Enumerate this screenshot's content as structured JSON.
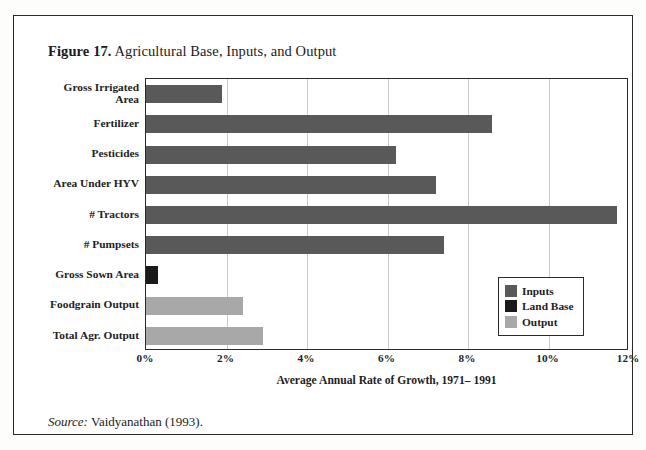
{
  "figure": {
    "number_label": "Figure 17.",
    "title": "Agricultural Base, Inputs, and Output",
    "source_label": "Source:",
    "source_text": " Vaidyanathan (1993)."
  },
  "colors": {
    "inputs": "#595959",
    "land_base": "#1a1a1a",
    "output": "#a8a8a8",
    "frame": "#2b2b2b",
    "gridline": "#c9c9c9",
    "background": "#ffffff"
  },
  "legend": {
    "position": "inside-bottom-right",
    "items": [
      {
        "label": "Inputs",
        "color": "#595959"
      },
      {
        "label": "Land Base",
        "color": "#1a1a1a"
      },
      {
        "label": "Output",
        "color": "#a8a8a8"
      }
    ]
  },
  "chart_data": {
    "type": "bar",
    "orientation": "horizontal",
    "title": "Figure 17. Agricultural Base, Inputs, and Output",
    "xlabel": "Average Annual Rate of Growth, 1971– 1991",
    "ylabel": "",
    "xlim": [
      0,
      12
    ],
    "xtick_values": [
      0,
      2,
      4,
      6,
      8,
      10,
      12
    ],
    "xtick_labels": [
      "0%",
      "2%",
      "4%",
      "6%",
      "8%",
      "10%",
      "12%"
    ],
    "grid": "vertical",
    "legend": [
      "Inputs",
      "Land Base",
      "Output"
    ],
    "categories": [
      "Gross Irrigated Area",
      "Fertilizer",
      "Pesticides",
      "Area Under HYV",
      "# Tractors",
      "# Pumpsets",
      "Gross Sown Area",
      "Foodgrain Output",
      "Total Agr. Output"
    ],
    "values": [
      1.9,
      8.6,
      6.2,
      7.2,
      11.7,
      7.4,
      0.3,
      2.4,
      2.9
    ],
    "groups": [
      "Inputs",
      "Inputs",
      "Inputs",
      "Inputs",
      "Inputs",
      "Inputs",
      "Land Base",
      "Output",
      "Output"
    ],
    "bars": [
      {
        "category": "Gross Irrigated Area",
        "category_lines": [
          "Gross Irrigated",
          "Area"
        ],
        "value": 1.9,
        "group": "Inputs",
        "color": "#595959"
      },
      {
        "category": "Fertilizer",
        "category_lines": [
          "Fertilizer"
        ],
        "value": 8.6,
        "group": "Inputs",
        "color": "#595959"
      },
      {
        "category": "Pesticides",
        "category_lines": [
          "Pesticides"
        ],
        "value": 6.2,
        "group": "Inputs",
        "color": "#595959"
      },
      {
        "category": "Area Under HYV",
        "category_lines": [
          "Area Under HYV"
        ],
        "value": 7.2,
        "group": "Inputs",
        "color": "#595959"
      },
      {
        "category": "# Tractors",
        "category_lines": [
          "# Tractors"
        ],
        "value": 11.7,
        "group": "Inputs",
        "color": "#595959"
      },
      {
        "category": "# Pumpsets",
        "category_lines": [
          "# Pumpsets"
        ],
        "value": 7.4,
        "group": "Inputs",
        "color": "#595959"
      },
      {
        "category": "Gross Sown Area",
        "category_lines": [
          "Gross Sown Area"
        ],
        "value": 0.3,
        "group": "Land Base",
        "color": "#1a1a1a"
      },
      {
        "category": "Foodgrain Output",
        "category_lines": [
          "Foodgrain Output"
        ],
        "value": 2.4,
        "group": "Output",
        "color": "#a8a8a8"
      },
      {
        "category": "Total Agr. Output",
        "category_lines": [
          "Total Agr. Output"
        ],
        "value": 2.9,
        "group": "Output",
        "color": "#a8a8a8"
      }
    ]
  }
}
